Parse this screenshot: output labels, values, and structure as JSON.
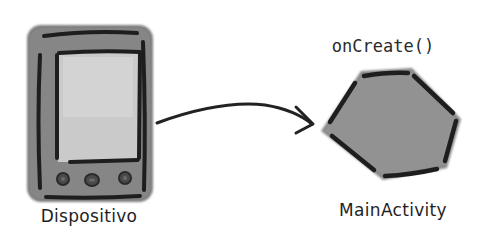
{
  "diagram": {
    "nodes": [
      {
        "id": "device",
        "label": "Dispositivo",
        "shape": "handheld-device"
      },
      {
        "id": "activity",
        "label": "MainActivity",
        "shape": "hexagon",
        "annotation": "onCreate()"
      }
    ],
    "edges": [
      {
        "from": "device",
        "to": "activity",
        "style": "curved-arrow"
      }
    ]
  },
  "colors": {
    "background": "#ffffff",
    "device_body": "#7d7d7d",
    "device_screen": "#c9c9c9",
    "hexagon_fill": "#8f8f8f",
    "outline": "#1e1e1e"
  }
}
